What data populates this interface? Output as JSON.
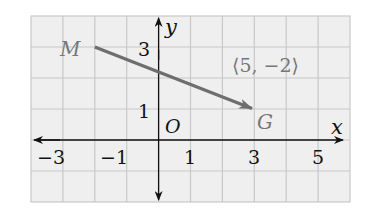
{
  "diagram": {
    "type": "coordinate-plane-vector",
    "grid": {
      "x_min": -4,
      "x_max": 6,
      "y_min": -2,
      "y_max": 4,
      "step": 1
    },
    "axes": {
      "x_label": "x",
      "y_label": "y",
      "origin_label": "O"
    },
    "x_ticks": [
      {
        "value": -3,
        "label": "−3"
      },
      {
        "value": -1,
        "label": "−1"
      },
      {
        "value": 1,
        "label": "1"
      },
      {
        "value": 3,
        "label": "3"
      },
      {
        "value": 5,
        "label": "5"
      }
    ],
    "y_ticks": [
      {
        "value": 1,
        "label": "1"
      },
      {
        "value": 3,
        "label": "3"
      }
    ],
    "points": {
      "M": {
        "label": "M",
        "x": -2,
        "y": 3
      },
      "G": {
        "label": "G",
        "x": 3,
        "y": 1
      }
    },
    "vector": {
      "from": "M",
      "to": "G",
      "label": "⟨5, −2⟩",
      "color": "#6e6e6e"
    },
    "colors": {
      "grid_bg": "#efefef",
      "grid_line": "#c8c8c8",
      "axis": "#111111",
      "point_label": "#777777"
    }
  }
}
